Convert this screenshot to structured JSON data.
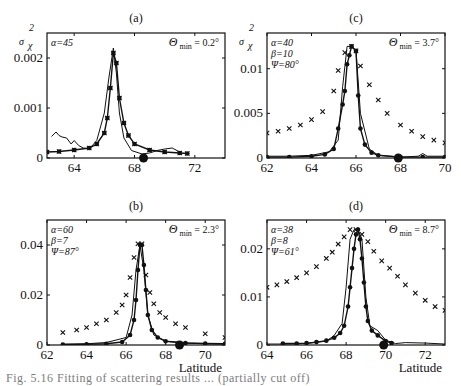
{
  "chart_data": [
    {
      "panel": "(a)",
      "type": "line",
      "title": "(a)",
      "ylabel": "σ_χ²",
      "xlabel": "",
      "xlim": [
        62.2,
        74
      ],
      "ylim": [
        0,
        0.0025
      ],
      "xticks": [
        "64",
        "68",
        "72"
      ],
      "yticks": [
        "0",
        "0.001",
        "0.002"
      ],
      "params": [
        "α=45"
      ],
      "theta_min": "Θ min = 0.2°",
      "min_marker_lat": 68.6,
      "grid": false,
      "series": [
        {
          "name": "observed",
          "style": "thin-line",
          "x": [
            62.5,
            62.8,
            63.0,
            63.2,
            63.5,
            63.8,
            64.0,
            64.3,
            64.6,
            65.0,
            65.5,
            66.0,
            66.3,
            66.6,
            66.8,
            67.0,
            67.3,
            67.8,
            68.5,
            69.0,
            69.5,
            70.0,
            70.5,
            71.0
          ],
          "y": [
            0.00043,
            0.00052,
            0.00045,
            0.00042,
            0.0004,
            0.00028,
            0.00035,
            0.00025,
            0.0002,
            0.00018,
            0.00035,
            0.0009,
            0.0016,
            0.0022,
            0.0017,
            0.0009,
            0.0004,
            0.00015,
            8e-05,
            0.0001,
            0.00015,
            0.00018,
            0.0002,
            0.00012
          ]
        },
        {
          "name": "model-x",
          "style": "x-markers",
          "x": [
            62.2,
            63,
            64,
            65,
            65.5,
            66,
            66.2,
            66.4,
            66.6,
            66.8,
            67,
            67.3,
            67.6,
            68,
            69,
            70,
            71,
            71.5
          ],
          "y": [
            0.00012,
            0.00013,
            0.00016,
            0.0002,
            0.00028,
            0.0005,
            0.0008,
            0.0014,
            0.0021,
            0.0019,
            0.0012,
            0.0007,
            0.00045,
            0.00028,
            0.00016,
            0.00012,
            0.0001,
            9e-05
          ]
        },
        {
          "name": "model-dot",
          "style": "dot-markers",
          "x": [
            62.2,
            63,
            64,
            65,
            65.5,
            66,
            66.2,
            66.4,
            66.6,
            66.8,
            67,
            67.3,
            67.6,
            68,
            69,
            70,
            71,
            71.5
          ],
          "y": [
            0.00012,
            0.00013,
            0.00016,
            0.0002,
            0.00028,
            0.0005,
            0.0008,
            0.0014,
            0.0021,
            0.0019,
            0.0012,
            0.0007,
            0.00045,
            0.00028,
            0.00016,
            0.00012,
            0.0001,
            9e-05
          ]
        }
      ]
    },
    {
      "panel": "(c)",
      "type": "line",
      "title": "(c)",
      "ylabel": "σ_χ²",
      "xlabel": "",
      "xlim": [
        62,
        70
      ],
      "ylim": [
        0,
        0.014
      ],
      "xticks": [
        "62",
        "64",
        "66",
        "68",
        "70"
      ],
      "yticks": [
        "0",
        "0.005",
        "0.01"
      ],
      "params": [
        "α=40",
        "β=10",
        "Ψ=80°"
      ],
      "theta_min": "Θ min = 3.7°",
      "min_marker_lat": 67.9,
      "grid": false,
      "series": [
        {
          "name": "observed",
          "style": "thin-line",
          "x": [
            62,
            63,
            64,
            64.8,
            65.2,
            65.4,
            65.6,
            65.8,
            66.0,
            66.2,
            66.6,
            67,
            68,
            68.8,
            69,
            69.2,
            70
          ],
          "y": [
            0.0002,
            0.0002,
            0.0003,
            0.0007,
            0.002,
            0.008,
            0.0125,
            0.0125,
            0.012,
            0.005,
            0.001,
            0.0003,
            0.0001,
            0.0002,
            0.0005,
            0.0002,
            0.0002
          ]
        },
        {
          "name": "model-x",
          "style": "x-markers",
          "x": [
            62,
            62.5,
            63,
            63.5,
            64,
            64.5,
            65,
            65.2,
            65.5,
            65.8,
            66,
            66.2,
            66.6,
            67,
            67.4,
            68,
            68.5,
            69,
            69.5,
            70
          ],
          "y": [
            0.0028,
            0.003,
            0.0033,
            0.0037,
            0.0043,
            0.0052,
            0.0075,
            0.0098,
            0.0118,
            0.0125,
            0.012,
            0.0103,
            0.0082,
            0.0065,
            0.005,
            0.0037,
            0.003,
            0.0024,
            0.002,
            0.0017
          ]
        },
        {
          "name": "model-dot",
          "style": "dot-markers",
          "x": [
            62,
            63,
            64,
            64.6,
            65,
            65.2,
            65.4,
            65.5,
            65.6,
            65.7,
            65.8,
            66.0,
            66.1,
            66.2,
            66.4,
            66.7,
            67,
            68,
            69,
            70
          ],
          "y": [
            0.0001,
            0.0001,
            0.0002,
            0.0004,
            0.001,
            0.0033,
            0.006,
            0.0075,
            0.0105,
            0.0115,
            0.0125,
            0.012,
            0.007,
            0.0033,
            0.0015,
            0.0006,
            0.0003,
            0.0001,
            0.0001,
            0.0001
          ]
        }
      ]
    },
    {
      "panel": "(b)",
      "type": "line",
      "title": "(b)",
      "ylabel": "",
      "xlabel": "Latitude",
      "xlim": [
        62,
        71
      ],
      "ylim": [
        0,
        0.05
      ],
      "xticks": [
        "62",
        "64",
        "66",
        "68",
        "70"
      ],
      "yticks": [
        "0",
        "0.02",
        "0.04"
      ],
      "params": [
        "α=60",
        "β=7",
        "Ψ=87°"
      ],
      "theta_min": "Θ min = 2.3°",
      "min_marker_lat": 68.7,
      "grid": false,
      "series": [
        {
          "name": "observed",
          "style": "thin-line",
          "x": [
            62.8,
            64,
            65,
            66,
            66.3,
            66.5,
            66.7,
            66.9,
            67.1,
            67.4,
            68,
            69,
            70,
            71
          ],
          "y": [
            0.0003,
            0.0005,
            0.001,
            0.003,
            0.012,
            0.03,
            0.04,
            0.03,
            0.012,
            0.004,
            0.0015,
            0.0008,
            0.0005,
            0.0003
          ]
        },
        {
          "name": "model-x",
          "style": "x-markers",
          "x": [
            62.8,
            63.5,
            64,
            64.5,
            65,
            65.5,
            65.8,
            66,
            66.2,
            66.4,
            66.6,
            66.8,
            67,
            67.2,
            67.4,
            67.7,
            68,
            68.5,
            69,
            70,
            71
          ],
          "y": [
            0.005,
            0.006,
            0.007,
            0.0085,
            0.01,
            0.013,
            0.016,
            0.02,
            0.027,
            0.035,
            0.0405,
            0.0405,
            0.028,
            0.021,
            0.0165,
            0.013,
            0.011,
            0.0085,
            0.007,
            0.0045,
            0.003
          ]
        },
        {
          "name": "model-dot",
          "style": "dot-markers",
          "x": [
            62.8,
            64,
            65,
            65.8,
            66.2,
            66.4,
            66.5,
            66.6,
            66.7,
            66.8,
            66.9,
            67,
            67.1,
            67.3,
            67.6,
            68,
            69,
            70,
            71
          ],
          "y": [
            0.0002,
            0.0003,
            0.0005,
            0.0012,
            0.004,
            0.01,
            0.018,
            0.03,
            0.04,
            0.04,
            0.032,
            0.022,
            0.012,
            0.006,
            0.003,
            0.0015,
            0.0008,
            0.0006,
            0.0005
          ]
        }
      ]
    },
    {
      "panel": "(d)",
      "type": "line",
      "title": "(d)",
      "ylabel": "",
      "xlabel": "Latitude",
      "xlim": [
        64,
        73
      ],
      "ylim": [
        0,
        0.026
      ],
      "xticks": [
        "64",
        "66",
        "68",
        "70",
        "72"
      ],
      "yticks": [
        "0",
        "0.01",
        "0.02"
      ],
      "params": [
        "α=38",
        "β=8",
        "Ψ=61°"
      ],
      "theta_min": "Θ min = 8.7°",
      "min_marker_lat": 69.9,
      "grid": false,
      "series": [
        {
          "name": "observed",
          "style": "thin-line",
          "x": [
            64,
            65,
            66,
            67,
            67.4,
            67.8,
            68,
            68.2,
            68.4,
            68.6,
            68.8,
            69,
            69.2,
            69.6,
            70,
            70.5,
            71,
            72,
            73
          ],
          "y": [
            0.0002,
            0.0002,
            0.0003,
            0.0008,
            0.002,
            0.0045,
            0.012,
            0.022,
            0.024,
            0.024,
            0.022,
            0.01,
            0.004,
            0.003,
            0.001,
            0.0003,
            0.0005,
            0.0004,
            0.0002
          ]
        },
        {
          "name": "model-x",
          "style": "x-markers",
          "x": [
            64,
            64.5,
            65,
            65.5,
            66,
            66.5,
            67,
            67.3,
            67.6,
            67.9,
            68.2,
            68.5,
            68.8,
            69.1,
            69.4,
            69.8,
            70.2,
            70.6,
            71,
            71.5,
            72,
            72.5,
            73
          ],
          "y": [
            0.012,
            0.0125,
            0.0132,
            0.014,
            0.015,
            0.0163,
            0.018,
            0.0193,
            0.021,
            0.0225,
            0.024,
            0.024,
            0.023,
            0.0215,
            0.0195,
            0.0175,
            0.016,
            0.0143,
            0.0125,
            0.0108,
            0.0093,
            0.008,
            0.0072
          ]
        },
        {
          "name": "model-dot",
          "style": "dot-markers",
          "x": [
            64.8,
            65.5,
            66,
            66.5,
            67,
            67.4,
            67.7,
            67.9,
            68.1,
            68.2,
            68.3,
            68.4,
            68.5,
            68.6,
            68.7,
            68.8,
            68.9,
            69.0,
            69.1,
            69.3,
            69.6,
            70,
            70.3
          ],
          "y": [
            0.0003,
            0.0003,
            0.0004,
            0.0006,
            0.0009,
            0.0015,
            0.0025,
            0.004,
            0.008,
            0.012,
            0.016,
            0.02,
            0.023,
            0.024,
            0.022,
            0.018,
            0.013,
            0.008,
            0.005,
            0.003,
            0.002,
            0.0008,
            0.0004
          ]
        }
      ]
    }
  ],
  "figure": {
    "caption_visible": "Fig. 5.16  Fitting of scattering results ... (partially cut off)"
  }
}
